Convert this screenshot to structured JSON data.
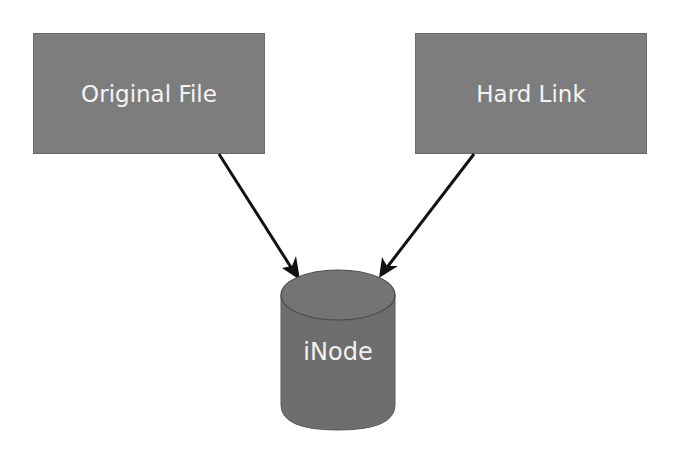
{
  "diagram": {
    "nodes": [
      {
        "id": "original",
        "label": "Original File",
        "shape": "rectangle"
      },
      {
        "id": "hardlink",
        "label": "Hard Link",
        "shape": "rectangle"
      },
      {
        "id": "inode",
        "label": "iNode",
        "shape": "cylinder"
      }
    ],
    "edges": [
      {
        "from": "original",
        "to": "inode"
      },
      {
        "from": "hardlink",
        "to": "inode"
      }
    ],
    "colors": {
      "box_fill": "#7d7d7d",
      "cylinder_fill": "#6e6e6e",
      "arrow": "#111111",
      "text": "#f4f4f4"
    }
  }
}
